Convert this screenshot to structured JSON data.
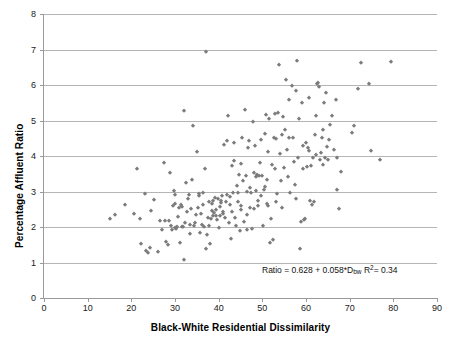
{
  "chart_data": {
    "type": "scatter",
    "title": "",
    "xlabel": "Black-White Residential Dissimilarity",
    "ylabel": "Percentage Affluent Ratio",
    "xlim": [
      0,
      90
    ],
    "ylim": [
      0,
      8
    ],
    "xticks": [
      0,
      10,
      20,
      30,
      40,
      50,
      60,
      70,
      80,
      90
    ],
    "yticks": [
      0,
      1,
      2,
      3,
      4,
      5,
      6,
      7,
      8
    ],
    "grid": "horizontal",
    "legend": "none",
    "marker": {
      "shape": "diamond",
      "color": "#7b7b7b",
      "size": 3.4
    },
    "annotations": [
      {
        "text": "Ratio = 0.628 + 0.058*Dbw  R2 = 0.34",
        "parts": {
          "lhs": "Ratio = 0.628 + 0.058*D",
          "sub": "bw",
          "r": " R",
          "sup": "2",
          "rhs": "= 0.34"
        },
        "x": 62,
        "y": 1.2
      }
    ],
    "fit": {
      "intercept": 0.628,
      "slope": 0.058,
      "r_squared": 0.34
    },
    "points": [
      [
        15.0,
        2.22
      ],
      [
        16.3,
        2.34
      ],
      [
        18.5,
        2.62
      ],
      [
        20.6,
        2.37
      ],
      [
        21.3,
        3.63
      ],
      [
        21.9,
        2.22
      ],
      [
        22.1,
        1.51
      ],
      [
        23.2,
        2.92
      ],
      [
        23.4,
        1.31
      ],
      [
        23.8,
        1.28
      ],
      [
        24.2,
        1.4
      ],
      [
        24.6,
        2.45
      ],
      [
        25.2,
        2.77
      ],
      [
        26.0,
        1.3
      ],
      [
        26.6,
        2.18
      ],
      [
        27.0,
        1.92
      ],
      [
        27.4,
        3.79
      ],
      [
        27.6,
        2.16
      ],
      [
        28.0,
        1.58
      ],
      [
        28.3,
        1.5
      ],
      [
        28.6,
        2.18
      ],
      [
        28.9,
        3.51
      ],
      [
        29.1,
        2.02
      ],
      [
        29.3,
        1.92
      ],
      [
        29.5,
        2.58
      ],
      [
        29.7,
        3.02
      ],
      [
        29.9,
        2.64
      ],
      [
        30.1,
        1.97
      ],
      [
        30.3,
        1.94
      ],
      [
        30.5,
        2.01
      ],
      [
        30.8,
        2.29
      ],
      [
        31.0,
        2.53
      ],
      [
        31.2,
        1.56
      ],
      [
        31.4,
        2.63
      ],
      [
        31.6,
        1.99
      ],
      [
        31.9,
        2.01
      ],
      [
        32.0,
        5.26
      ],
      [
        32.1,
        1.07
      ],
      [
        32.3,
        2.12
      ],
      [
        32.5,
        3.23
      ],
      [
        32.7,
        2.41
      ],
      [
        32.9,
        2.8
      ],
      [
        33.2,
        2.89
      ],
      [
        33.4,
        2.05
      ],
      [
        33.5,
        1.8
      ],
      [
        33.7,
        2.52
      ],
      [
        33.9,
        3.33
      ],
      [
        34.1,
        4.85
      ],
      [
        34.3,
        2.02
      ],
      [
        34.5,
        2.1
      ],
      [
        34.8,
        2.34
      ],
      [
        35.0,
        4.1
      ],
      [
        35.2,
        2.53
      ],
      [
        35.4,
        2.88
      ],
      [
        35.6,
        2.92
      ],
      [
        35.8,
        1.83
      ],
      [
        36.0,
        2.36
      ],
      [
        36.2,
        2.06
      ],
      [
        36.4,
        2.96
      ],
      [
        36.6,
        1.99
      ],
      [
        36.8,
        3.63
      ],
      [
        37.0,
        6.92
      ],
      [
        37.1,
        1.39
      ],
      [
        37.3,
        1.78
      ],
      [
        37.5,
        2.25
      ],
      [
        37.7,
        2.03
      ],
      [
        37.9,
        2.7
      ],
      [
        38.0,
        1.53
      ],
      [
        38.2,
        2.22
      ],
      [
        38.4,
        2.46
      ],
      [
        38.6,
        2.73
      ],
      [
        38.8,
        2.3
      ],
      [
        39.0,
        2.4
      ],
      [
        39.2,
        2.82
      ],
      [
        39.4,
        2.47
      ],
      [
        39.6,
        2.2
      ],
      [
        39.8,
        2.78
      ],
      [
        40.0,
        1.98
      ],
      [
        40.2,
        2.55
      ],
      [
        40.4,
        2.3
      ],
      [
        40.6,
        2.73
      ],
      [
        40.8,
        2.87
      ],
      [
        41.0,
        2.43
      ],
      [
        41.2,
        4.3
      ],
      [
        41.4,
        2.25
      ],
      [
        41.6,
        2.7
      ],
      [
        41.8,
        2.9
      ],
      [
        42.0,
        4.42
      ],
      [
        42.2,
        5.12
      ],
      [
        42.4,
        2.1
      ],
      [
        42.6,
        2.62
      ],
      [
        42.8,
        1.65
      ],
      [
        43.0,
        3.72
      ],
      [
        43.2,
        2.96
      ],
      [
        43.4,
        3.85
      ],
      [
        43.6,
        4.36
      ],
      [
        43.8,
        2.25
      ],
      [
        44.0,
        2.04
      ],
      [
        44.2,
        3.16
      ],
      [
        44.4,
        2.7
      ],
      [
        44.6,
        3.47
      ],
      [
        44.8,
        1.88
      ],
      [
        45.0,
        3.77
      ],
      [
        45.2,
        2.6
      ],
      [
        45.4,
        4.52
      ],
      [
        45.6,
        3.3
      ],
      [
        45.8,
        2.13
      ],
      [
        46.0,
        5.3
      ],
      [
        46.2,
        3.45
      ],
      [
        46.4,
        2.34
      ],
      [
        46.6,
        1.91
      ],
      [
        46.8,
        4.23
      ],
      [
        47.0,
        4.43
      ],
      [
        47.2,
        3.11
      ],
      [
        47.4,
        2.95
      ],
      [
        47.6,
        1.93
      ],
      [
        47.8,
        4.96
      ],
      [
        48.0,
        3.52
      ],
      [
        48.2,
        2.5
      ],
      [
        48.4,
        4.28
      ],
      [
        48.6,
        3.42
      ],
      [
        48.8,
        3.47
      ],
      [
        49.0,
        2.72
      ],
      [
        49.2,
        3.45
      ],
      [
        49.4,
        3.8
      ],
      [
        49.6,
        2.86
      ],
      [
        49.8,
        4.45
      ],
      [
        50.0,
        3.44
      ],
      [
        50.2,
        2.02
      ],
      [
        50.4,
        3.05
      ],
      [
        50.6,
        4.62
      ],
      [
        50.8,
        5.15
      ],
      [
        51.0,
        3.33
      ],
      [
        51.2,
        2.6
      ],
      [
        51.4,
        4.1
      ],
      [
        51.6,
        5.03
      ],
      [
        51.8,
        1.55
      ],
      [
        52.0,
        2.22
      ],
      [
        52.2,
        3.75
      ],
      [
        52.4,
        1.63
      ],
      [
        52.6,
        4.52
      ],
      [
        52.8,
        5.18
      ],
      [
        53.0,
        3.63
      ],
      [
        53.2,
        4.48
      ],
      [
        53.4,
        2.92
      ],
      [
        53.6,
        5.22
      ],
      [
        53.8,
        6.55
      ],
      [
        54.0,
        4.07
      ],
      [
        54.2,
        3.3
      ],
      [
        54.4,
        4.6
      ],
      [
        54.6,
        2.54
      ],
      [
        54.8,
        5.1
      ],
      [
        55.0,
        3.67
      ],
      [
        55.2,
        4.73
      ],
      [
        55.4,
        6.13
      ],
      [
        55.6,
        4.18
      ],
      [
        55.8,
        3.42
      ],
      [
        56.0,
        4.52
      ],
      [
        56.2,
        5.58
      ],
      [
        56.4,
        2.97
      ],
      [
        56.8,
        5.98
      ],
      [
        57.0,
        4.5
      ],
      [
        57.2,
        3.83
      ],
      [
        57.4,
        3.17
      ],
      [
        57.6,
        5.82
      ],
      [
        57.8,
        2.78
      ],
      [
        58.0,
        6.67
      ],
      [
        58.2,
        3.95
      ],
      [
        58.4,
        5.03
      ],
      [
        58.6,
        1.38
      ],
      [
        58.8,
        2.13
      ],
      [
        59.0,
        5.48
      ],
      [
        59.2,
        4.28
      ],
      [
        59.4,
        3.62
      ],
      [
        59.6,
        2.21
      ],
      [
        59.8,
        2.22
      ],
      [
        60.0,
        4.38
      ],
      [
        60.2,
        3.7
      ],
      [
        60.4,
        4.22
      ],
      [
        60.6,
        4.15
      ],
      [
        60.8,
        5.62
      ],
      [
        61.0,
        2.73
      ],
      [
        61.2,
        3.73
      ],
      [
        61.4,
        2.63
      ],
      [
        61.6,
        3.95
      ],
      [
        61.8,
        2.7
      ],
      [
        62.0,
        4.6
      ],
      [
        62.2,
        4.02
      ],
      [
        62.4,
        5.12
      ],
      [
        62.6,
        6.02
      ],
      [
        62.8,
        6.07
      ],
      [
        63.0,
        5.95
      ],
      [
        63.2,
        3.88
      ],
      [
        63.4,
        4.08
      ],
      [
        63.6,
        4.52
      ],
      [
        63.8,
        3.75
      ],
      [
        64.0,
        4.72
      ],
      [
        64.2,
        5.5
      ],
      [
        64.4,
        3.95
      ],
      [
        64.6,
        5.78
      ],
      [
        64.8,
        4.25
      ],
      [
        65.0,
        3.88
      ],
      [
        65.2,
        4.45
      ],
      [
        65.4,
        4.88
      ],
      [
        66.0,
        5.12
      ],
      [
        66.4,
        4.18
      ],
      [
        66.8,
        5.58
      ],
      [
        67.0,
        3.95
      ],
      [
        67.2,
        3.03
      ],
      [
        67.6,
        2.5
      ],
      [
        68.0,
        3.55
      ],
      [
        70.5,
        4.65
      ],
      [
        71.0,
        4.85
      ],
      [
        72.0,
        5.88
      ],
      [
        72.5,
        6.62
      ],
      [
        74.5,
        6.02
      ],
      [
        74.8,
        4.13
      ],
      [
        77.0,
        3.88
      ],
      [
        79.5,
        6.65
      ],
      [
        30.0,
        2.9
      ],
      [
        31.5,
        2.55
      ],
      [
        36.5,
        2.62
      ],
      [
        38.5,
        2.65
      ],
      [
        40.5,
        2.68
      ],
      [
        42.5,
        2.85
      ],
      [
        44.5,
        2.95
      ],
      [
        46.5,
        2.98
      ],
      [
        48.5,
        3.02
      ],
      [
        50.5,
        3.12
      ],
      [
        39.3,
        2.3
      ],
      [
        41.1,
        2.36
      ],
      [
        43.1,
        2.42
      ],
      [
        45.1,
        2.48
      ],
      [
        47.1,
        2.53
      ],
      [
        49.1,
        2.58
      ],
      [
        51.1,
        2.64
      ],
      [
        53.1,
        2.7
      ]
    ]
  },
  "axes": {
    "x_tick_labels": [
      "0",
      "10",
      "20",
      "30",
      "40",
      "50",
      "60",
      "70",
      "80",
      "90"
    ],
    "y_tick_labels": [
      "0",
      "1",
      "2",
      "3",
      "4",
      "5",
      "6",
      "7",
      "8"
    ],
    "x_title": "Black-White Residential Dissimilarity",
    "y_title": "Percentage Affluent Ratio"
  },
  "annotation": {
    "lhs": "Ratio = 0.628 + 0.058*D",
    "sub": "bw",
    "r_text": " R",
    "sup": "2",
    "rhs": "= 0.34"
  },
  "colors": {
    "marker": "#7b7b7b",
    "gridline": "#b5b5b5",
    "axis": "#9a9a9a",
    "text": "#1a1a1a",
    "background": "#ffffff"
  }
}
